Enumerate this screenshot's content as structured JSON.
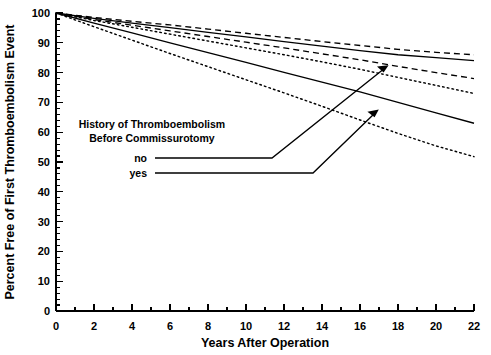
{
  "chart_data": {
    "type": "line",
    "title": "",
    "xlabel": "Years After Operation",
    "ylabel": "Percent Free of First Thromboembolism Event",
    "xlim": [
      0,
      22
    ],
    "ylim": [
      0,
      100
    ],
    "grid": false,
    "legend_position": "inside-left",
    "x_ticks_major": [
      0,
      2,
      4,
      6,
      8,
      10,
      12,
      14,
      16,
      18,
      20,
      22
    ],
    "x_ticks_minor": [
      1,
      3,
      5,
      7,
      9,
      11,
      13,
      15,
      17,
      19,
      21
    ],
    "y_ticks_major": [
      0,
      10,
      20,
      30,
      40,
      50,
      60,
      70,
      80,
      90,
      100
    ],
    "y_tick_minor_step": 2,
    "x": [
      0,
      2,
      4,
      6,
      8,
      10,
      12,
      14,
      16,
      18,
      20,
      22
    ],
    "series": [
      {
        "name": "no - upper confidence limit",
        "style": "dashed",
        "group": "no",
        "role": "upper-ci",
        "values": [
          100,
          98.5,
          97.2,
          96.0,
          94.6,
          93.2,
          91.8,
          90.4,
          89.1,
          87.8,
          86.8,
          86.0
        ]
      },
      {
        "name": "no - estimate",
        "style": "solid",
        "group": "no",
        "role": "estimate",
        "values": [
          100,
          98.2,
          96.6,
          95.1,
          93.5,
          92.0,
          90.4,
          88.9,
          87.4,
          86.0,
          85.0,
          84.0
        ]
      },
      {
        "name": "no - lower confidence limit",
        "style": "dashed",
        "group": "no",
        "role": "lower-ci",
        "values": [
          100,
          97.8,
          95.9,
          94.0,
          92.1,
          90.2,
          88.3,
          86.3,
          84.3,
          82.1,
          80.0,
          78.0
        ]
      },
      {
        "name": "yes - upper confidence limit",
        "style": "dotted",
        "group": "yes",
        "role": "upper-ci",
        "values": [
          100,
          97.5,
          95.2,
          92.9,
          90.6,
          88.3,
          86.0,
          83.6,
          81.1,
          78.4,
          75.7,
          73.0
        ]
      },
      {
        "name": "yes - estimate",
        "style": "solid",
        "group": "yes",
        "role": "estimate",
        "values": [
          100,
          96.6,
          93.3,
          90.0,
          86.7,
          83.4,
          80.1,
          76.8,
          73.5,
          70.0,
          66.5,
          63.0
        ]
      },
      {
        "name": "yes - lower confidence limit",
        "style": "dotted",
        "group": "yes",
        "role": "lower-ci",
        "values": [
          100,
          95.4,
          90.9,
          86.4,
          82.0,
          77.6,
          73.2,
          68.7,
          64.1,
          59.6,
          55.4,
          51.8
        ]
      }
    ]
  },
  "legend": {
    "title_line1": "History of Thromboembolism",
    "title_line2": "Before Commissurotomy",
    "items": [
      {
        "label": "no"
      },
      {
        "label": "yes"
      }
    ]
  },
  "axes": {
    "x_title": "Years After Operation",
    "y_title": "Percent Free of First Thromboembolism Event",
    "x_tick_labels": [
      "0",
      "2",
      "4",
      "6",
      "8",
      "10",
      "12",
      "14",
      "16",
      "18",
      "20",
      "22"
    ],
    "y_tick_labels": [
      "0",
      "10",
      "20",
      "30",
      "40",
      "50",
      "60",
      "70",
      "80",
      "90",
      "100"
    ]
  },
  "colors": {
    "ink": "#000000",
    "background": "#ffffff"
  }
}
